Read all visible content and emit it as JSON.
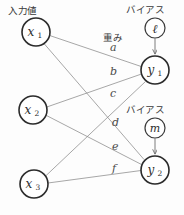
{
  "diagram": {
    "type": "neural-network",
    "headers": {
      "input_label": "入力値",
      "weight_label": "重み",
      "bias_label_1": "バイアス",
      "bias_label_2": "バイアス"
    },
    "input_nodes": [
      {
        "id": "x1",
        "base": "x",
        "sub": "1",
        "cx": 36,
        "cy": 32,
        "r": 14
      },
      {
        "id": "x2",
        "base": "x",
        "sub": "2",
        "cx": 33,
        "cy": 110,
        "r": 14
      },
      {
        "id": "x3",
        "base": "x",
        "sub": "3",
        "cx": 34,
        "cy": 184,
        "r": 14
      }
    ],
    "output_nodes": [
      {
        "id": "y1",
        "base": "y",
        "sub": "1",
        "cx": 155,
        "cy": 70,
        "r": 14
      },
      {
        "id": "y2",
        "base": "y",
        "sub": "2",
        "cx": 155,
        "cy": 170,
        "r": 14
      }
    ],
    "bias_nodes": [
      {
        "id": "l",
        "base": "ℓ",
        "cx": 155,
        "cy": 28,
        "r": 10
      },
      {
        "id": "m",
        "base": "m",
        "cx": 155,
        "cy": 128,
        "r": 10
      }
    ],
    "edges": [
      {
        "from": "x1",
        "to": "y1",
        "weight": "a",
        "lx": 110,
        "ly": 51
      },
      {
        "from": "x2",
        "to": "y1",
        "weight": "b",
        "lx": 110,
        "ly": 75
      },
      {
        "from": "x3",
        "to": "y1",
        "weight": "c",
        "lx": 110,
        "ly": 97
      },
      {
        "from": "x1",
        "to": "y2",
        "weight": "d",
        "lx": 112,
        "ly": 126
      },
      {
        "from": "x2",
        "to": "y2",
        "weight": "e",
        "lx": 112,
        "ly": 150
      },
      {
        "from": "x3",
        "to": "y2",
        "weight": "f",
        "lx": 112,
        "ly": 172
      }
    ],
    "bias_edges": [
      {
        "from": "l",
        "to": "y1"
      },
      {
        "from": "m",
        "to": "y2"
      }
    ],
    "colors": {
      "node_stroke": "#2b2b2b",
      "edge_stroke": "#8a8a8a",
      "text": "#2e2e2e",
      "background": "#fdfdfd"
    }
  }
}
